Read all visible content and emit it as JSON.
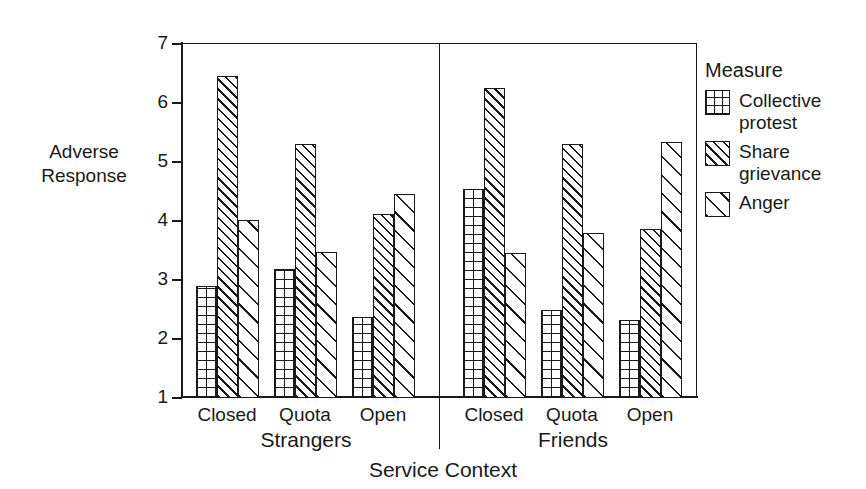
{
  "chart_data": {
    "type": "bar",
    "title": "",
    "xlabel": "Service Context",
    "ylabel": "Adverse Response",
    "ylim": [
      1,
      7
    ],
    "yticks": [
      1,
      2,
      3,
      4,
      5,
      6,
      7
    ],
    "grid": false,
    "legend_position": "right",
    "legend_title": "Measure",
    "panels": [
      "Strangers",
      "Friends"
    ],
    "categories": [
      "Closed",
      "Quota",
      "Open"
    ],
    "series": [
      {
        "name": "Collective protest",
        "pattern": "grid",
        "values_strangers": [
          2.9,
          3.18,
          2.37
        ],
        "values_friends": [
          4.54,
          2.5,
          2.33
        ]
      },
      {
        "name": "Share grievance",
        "pattern": "diagonal-dense",
        "values_strangers": [
          6.45,
          5.3,
          4.12
        ],
        "values_friends": [
          6.26,
          5.3,
          3.86
        ]
      },
      {
        "name": "Anger",
        "pattern": "diagonal-sparse",
        "values_strangers": [
          4.02,
          3.47,
          4.46
        ],
        "values_friends": [
          3.45,
          3.79,
          5.34
        ]
      }
    ],
    "colors": {
      "ink": "#1a1a1a",
      "background": "#ffffff"
    }
  },
  "axis": {
    "y_title_line1": "Adverse",
    "y_title_line2": "Response",
    "tick_labels": [
      "7",
      "6",
      "5",
      "4",
      "3",
      "2",
      "1"
    ],
    "x_title": "Service Context"
  },
  "panels": [
    {
      "label": "Strangers",
      "groups": [
        {
          "label": "Closed",
          "bars": [
            2.9,
            6.45,
            4.02
          ]
        },
        {
          "label": "Quota",
          "bars": [
            3.18,
            5.3,
            3.47
          ]
        },
        {
          "label": "Open",
          "bars": [
            2.37,
            4.12,
            4.46
          ]
        }
      ]
    },
    {
      "label": "Friends",
      "groups": [
        {
          "label": "Closed",
          "bars": [
            4.54,
            6.26,
            3.45
          ]
        },
        {
          "label": "Quota",
          "bars": [
            2.5,
            5.3,
            3.79
          ]
        },
        {
          "label": "Open",
          "bars": [
            2.33,
            3.86,
            5.34
          ]
        }
      ]
    }
  ],
  "legend": {
    "title": "Measure",
    "items": [
      {
        "label": "Collective protest",
        "icon": "grid-swatch-icon"
      },
      {
        "label": "Share grievance",
        "icon": "diagonal-dense-swatch-icon"
      },
      {
        "label": "Anger",
        "icon": "diagonal-sparse-swatch-icon"
      }
    ]
  }
}
